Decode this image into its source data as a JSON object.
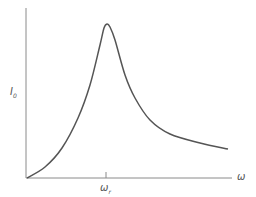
{
  "chart_data": {
    "type": "line",
    "title": "",
    "xlabel": "ω",
    "ylabel": "I0",
    "ylabel_main": "I",
    "ylabel_sub": "0",
    "x_ticks": [
      {
        "label_main": "ω",
        "label_sub": "r",
        "x": 106
      }
    ],
    "grid": false,
    "legend": null,
    "series": [
      {
        "name": "I0(ω)",
        "color": "#555555",
        "points": [
          [
            27,
            178
          ],
          [
            45,
            167
          ],
          [
            62,
            148
          ],
          [
            78,
            118
          ],
          [
            90,
            85
          ],
          [
            100,
            45
          ],
          [
            104,
            28
          ],
          [
            107,
            24
          ],
          [
            110,
            27
          ],
          [
            115,
            40
          ],
          [
            125,
            75
          ],
          [
            135,
            98
          ],
          [
            150,
            120
          ],
          [
            170,
            134
          ],
          [
            200,
            143
          ],
          [
            228,
            149
          ]
        ]
      }
    ]
  }
}
